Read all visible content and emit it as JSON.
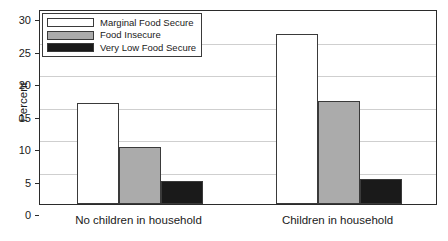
{
  "chart_data": {
    "type": "bar",
    "title": "",
    "xlabel": "",
    "ylabel": "Percent",
    "ylim": [
      0,
      30
    ],
    "ytick_values": [
      0,
      5,
      10,
      15,
      20,
      25,
      30
    ],
    "ytick_labels": [
      "0",
      "5",
      "10",
      "15",
      "20",
      "25",
      "30"
    ],
    "grid": true,
    "legend_position": "upper left",
    "categories": [
      "No children in household",
      "Children in household"
    ],
    "series": [
      {
        "name": "Marginal Food Secure",
        "color": "#ffffff",
        "edge_color": "#3a3a3a",
        "values": [
          15.6,
          26.1
        ]
      },
      {
        "name": "Food Insecure",
        "color": "#ababab",
        "edge_color": "#3a3a3a",
        "values": [
          8.8,
          15.9
        ]
      },
      {
        "name": "Very Low Food Secure",
        "color": "#1a1a1a",
        "edge_color": "#3a3a3a",
        "values": [
          3.5,
          3.9
        ]
      }
    ]
  },
  "axis": {
    "y_title": "Percent"
  },
  "legend": {
    "items": [
      {
        "label": "Marginal Food Secure"
      },
      {
        "label": "Food Insecure"
      },
      {
        "label": "Very Low Food Secure"
      }
    ]
  },
  "ticks": {
    "y": [
      "0",
      "5",
      "10",
      "15",
      "20",
      "25",
      "30"
    ]
  },
  "categories": [
    {
      "label": "No children in household"
    },
    {
      "label": "Children in household"
    }
  ],
  "title_remnant": ""
}
